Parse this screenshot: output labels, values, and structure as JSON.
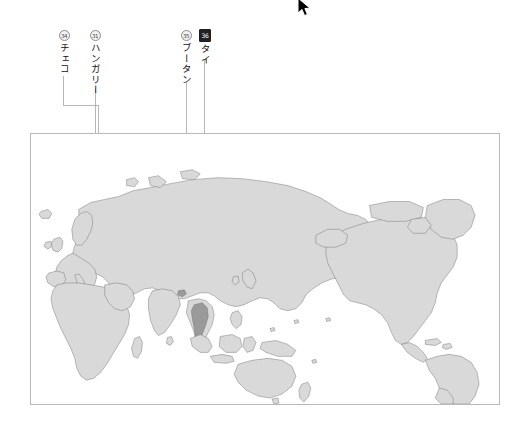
{
  "document": {
    "title": "世界地図 国名ラベル",
    "background_color": "#ffffff"
  },
  "map": {
    "name": "world-map",
    "frame_color": "#b9b9b9",
    "land_color": "#d9d9d9",
    "border_color": "#6e6e6e",
    "ocean_color": "#ffffff",
    "highlight_color": "#9a9a9a",
    "projection": "equirectangular-pacific-centered"
  },
  "callouts": [
    {
      "id": "czechia",
      "badge": "34",
      "label": "チェコ",
      "badge_style": "light",
      "x": 63,
      "y": 30
    },
    {
      "id": "hungary",
      "badge": "31",
      "label": "ハンガリー",
      "badge_style": "light",
      "x": 93,
      "y": 30
    },
    {
      "id": "bhutan",
      "badge": "35",
      "label": "ブータン",
      "badge_style": "light",
      "x": 184,
      "y": 30
    },
    {
      "id": "thailand",
      "badge": "36",
      "label": "タイ",
      "badge_style": "dark",
      "x": 203,
      "y": 30
    }
  ],
  "cursor": {
    "type": "arrow-pointer",
    "x": 300,
    "y": 4
  }
}
